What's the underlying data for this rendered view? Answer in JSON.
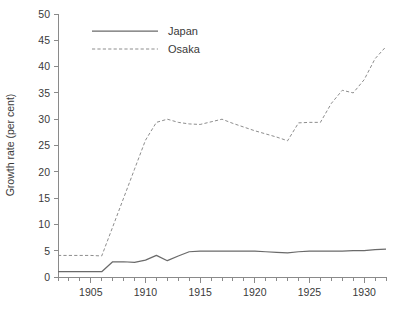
{
  "chart_data": {
    "type": "line",
    "title": "",
    "xlabel": "",
    "ylabel": "Growth rate (per cent)",
    "xlim": [
      1902,
      1932
    ],
    "ylim": [
      0,
      50
    ],
    "grid": false,
    "legend_position": "top-center",
    "y_ticks": [
      0,
      5,
      10,
      15,
      20,
      25,
      30,
      35,
      40,
      45,
      50
    ],
    "x_ticks": [
      1905,
      1910,
      1915,
      1920,
      1925,
      1930
    ],
    "x_minor_tick_interval": 1,
    "x": [
      1902,
      1903,
      1904,
      1905,
      1906,
      1907,
      1908,
      1909,
      1910,
      1911,
      1912,
      1913,
      1914,
      1915,
      1916,
      1917,
      1918,
      1919,
      1920,
      1921,
      1922,
      1923,
      1924,
      1925,
      1926,
      1927,
      1928,
      1929,
      1930,
      1931,
      1932
    ],
    "series": [
      {
        "name": "Japan",
        "style": "solid",
        "color": "#6a6a6a",
        "values": [
          1.0,
          1.0,
          1.0,
          1.0,
          1.0,
          2.9,
          2.9,
          2.8,
          3.2,
          4.1,
          3.1,
          4.0,
          4.8,
          4.9,
          4.9,
          4.9,
          4.9,
          4.9,
          4.9,
          4.8,
          4.7,
          4.6,
          4.8,
          4.9,
          4.9,
          4.9,
          4.9,
          5.0,
          5.0,
          5.2,
          5.3
        ]
      },
      {
        "name": "Osaka",
        "style": "dashed",
        "color": "#8d8d8d",
        "values": [
          4.1,
          4.1,
          4.1,
          4.1,
          4.0,
          9.5,
          15.0,
          20.5,
          26.0,
          29.4,
          30.0,
          29.4,
          29.1,
          29.0,
          29.5,
          30.0,
          29.2,
          28.5,
          27.8,
          27.2,
          26.6,
          25.9,
          29.3,
          29.4,
          29.4,
          33.0,
          35.5,
          35.0,
          37.5,
          41.5,
          43.8
        ]
      }
    ]
  },
  "legend": {
    "entries": [
      {
        "label": "Japan"
      },
      {
        "label": "Osaka"
      }
    ]
  },
  "axis": {
    "y_title": "Growth rate (per cent)"
  }
}
